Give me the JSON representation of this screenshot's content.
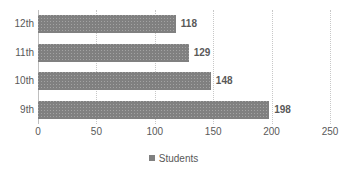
{
  "chart_data": {
    "type": "bar",
    "orientation": "horizontal",
    "title": "",
    "xlabel": "",
    "ylabel": "",
    "categories": [
      "12th",
      "11th",
      "10th",
      "9th"
    ],
    "values": [
      118,
      129,
      148,
      198
    ],
    "data_labels": [
      "118",
      "129",
      "148",
      "198"
    ],
    "series": [
      {
        "name": "Students",
        "values": [
          118,
          129,
          148,
          198
        ]
      }
    ],
    "xlim": [
      0,
      250
    ],
    "xticks": [
      0,
      50,
      100,
      150,
      200,
      250
    ],
    "xtick_labels": [
      "0",
      "50",
      "100",
      "150",
      "200",
      "250"
    ],
    "grid": "vertical-dotted",
    "legend": {
      "position": "bottom",
      "entries": [
        "Students"
      ]
    },
    "colors": {
      "bar": "#808080",
      "text": "#595959",
      "gridline": "#c8c8c8",
      "axis": "#bfbfbf",
      "background": "#ffffff"
    }
  },
  "legend": {
    "students_label": "Students"
  }
}
